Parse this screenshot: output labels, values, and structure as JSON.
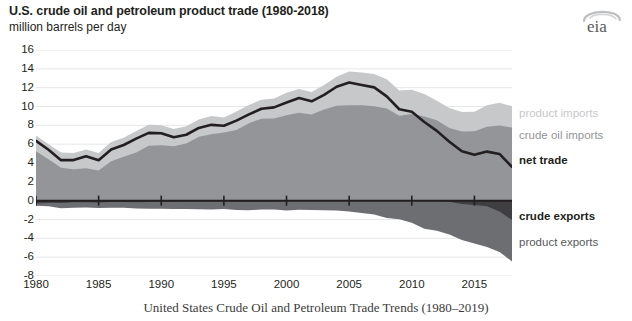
{
  "header": {
    "title": "U.S. crude oil and petroleum product trade (1980-2018)",
    "subtitle": "million barrels per day",
    "logo": "eia"
  },
  "caption": "United States Crude Oil and Petroleum Trade Trends (1980–2019)",
  "colors": {
    "product_imports": "#c6c8ca",
    "crude_oil_imports": "#939598",
    "net_trade": "#231f20",
    "crude_exports": "#3f3f42",
    "product_exports": "#6d6e71",
    "gridline": "#e6e7e8",
    "axis": "#231f20",
    "background": "#ffffff"
  },
  "legend": {
    "position": "right",
    "entries": [
      {
        "label": "product imports",
        "color": "#c6c8ca"
      },
      {
        "label": "crude oil imports",
        "color": "#939598"
      },
      {
        "label": "net trade",
        "color": "#231f20"
      },
      {
        "label": "crude exports",
        "color": "#3f3f42"
      },
      {
        "label": "product exports",
        "color": "#6d6e71"
      }
    ]
  },
  "chart_data": {
    "type": "area",
    "title": "U.S. crude oil and petroleum product trade (1980-2018)",
    "subtitle": "million barrels per day",
    "xlabel": "",
    "ylabel": "million barrels per day",
    "xlim": [
      1980,
      2018
    ],
    "ylim": [
      -8,
      16
    ],
    "ytick_labels": [
      "16",
      "14",
      "12",
      "10",
      "8",
      "6",
      "4",
      "2",
      "0",
      "-2",
      "-4",
      "-6",
      "-8"
    ],
    "yticks": [
      16,
      14,
      12,
      10,
      8,
      6,
      4,
      2,
      0,
      -2,
      -4,
      -6,
      -8
    ],
    "xticks": [
      1980,
      1985,
      1990,
      1995,
      2000,
      2005,
      2010,
      2015
    ],
    "xtick_labels": [
      "1980",
      "1985",
      "1990",
      "1995",
      "2000",
      "2005",
      "2010",
      "2015"
    ],
    "grid": true,
    "x": [
      1980,
      1981,
      1982,
      1983,
      1984,
      1985,
      1986,
      1987,
      1988,
      1989,
      1990,
      1991,
      1992,
      1993,
      1994,
      1995,
      1996,
      1997,
      1998,
      1999,
      2000,
      2001,
      2002,
      2003,
      2004,
      2005,
      2006,
      2007,
      2008,
      2009,
      2010,
      2011,
      2012,
      2013,
      2014,
      2015,
      2016,
      2017,
      2018
    ],
    "series": [
      {
        "name": "crude oil imports",
        "stack": "imports",
        "values": [
          5.26,
          4.4,
          3.49,
          3.33,
          3.43,
          3.2,
          4.18,
          4.67,
          5.11,
          5.84,
          5.89,
          5.78,
          6.08,
          6.79,
          7.06,
          7.23,
          7.51,
          8.23,
          8.71,
          8.73,
          9.07,
          9.33,
          9.14,
          9.67,
          10.09,
          10.13,
          10.12,
          10.03,
          9.78,
          9.01,
          9.21,
          8.94,
          8.53,
          7.73,
          7.34,
          7.36,
          7.85,
          7.97,
          7.76
        ]
      },
      {
        "name": "product imports",
        "stack": "imports",
        "values": [
          1.65,
          1.6,
          1.63,
          1.72,
          2.01,
          1.87,
          2.05,
          2.0,
          2.3,
          2.22,
          2.12,
          1.84,
          1.81,
          1.83,
          1.93,
          1.61,
          1.97,
          1.94,
          2.0,
          2.12,
          2.39,
          2.54,
          2.39,
          2.6,
          3.06,
          3.59,
          3.48,
          3.43,
          3.12,
          2.68,
          2.58,
          2.39,
          2.08,
          2.12,
          2.07,
          2.08,
          2.27,
          2.43,
          2.27
        ]
      },
      {
        "name": "crude exports",
        "stack": "exports",
        "values": [
          -0.29,
          -0.23,
          -0.24,
          -0.16,
          -0.18,
          -0.2,
          -0.15,
          -0.15,
          -0.16,
          -0.14,
          -0.11,
          -0.12,
          -0.09,
          -0.1,
          -0.1,
          -0.1,
          -0.11,
          -0.11,
          -0.11,
          -0.12,
          -0.05,
          -0.02,
          -0.01,
          -0.01,
          -0.03,
          -0.03,
          -0.03,
          -0.03,
          -0.03,
          -0.04,
          -0.04,
          -0.05,
          -0.07,
          -0.12,
          -0.35,
          -0.47,
          -0.59,
          -1.16,
          -2.05
        ]
      },
      {
        "name": "product exports",
        "stack": "exports",
        "values": [
          -0.26,
          -0.37,
          -0.57,
          -0.58,
          -0.54,
          -0.58,
          -0.61,
          -0.61,
          -0.66,
          -0.72,
          -0.75,
          -0.77,
          -0.8,
          -0.8,
          -0.84,
          -0.79,
          -0.87,
          -0.9,
          -0.84,
          -0.81,
          -0.99,
          -0.95,
          -0.98,
          -1.01,
          -1.02,
          -1.13,
          -1.29,
          -1.43,
          -1.8,
          -1.94,
          -2.31,
          -2.93,
          -3.13,
          -3.47,
          -3.82,
          -4.09,
          -4.32,
          -4.28,
          -4.4
        ]
      },
      {
        "name": "net trade",
        "type": "line",
        "values": [
          6.36,
          5.4,
          4.3,
          4.31,
          4.72,
          4.29,
          5.44,
          5.91,
          6.59,
          7.2,
          7.16,
          6.73,
          7.0,
          7.72,
          8.05,
          7.95,
          8.5,
          9.16,
          9.76,
          9.91,
          10.42,
          10.9,
          10.55,
          11.24,
          12.1,
          12.55,
          12.28,
          12.03,
          11.07,
          9.71,
          9.44,
          8.35,
          7.41,
          6.26,
          5.24,
          4.88,
          5.21,
          4.96,
          3.58
        ]
      }
    ],
    "annotations": [
      {
        "text": "net trade peaks near 12.5 million b/d in 2005",
        "x": 2005,
        "y": 12.55
      }
    ]
  }
}
